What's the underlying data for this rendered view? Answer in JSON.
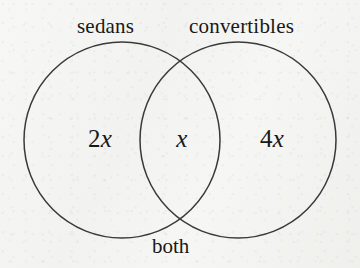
{
  "figure": {
    "kind": "venn-diagram",
    "background_color": "#f5f5f3",
    "stroke_color": "#3a3a3a",
    "text_color": "#181818"
  },
  "sets": {
    "left": {
      "name_label": "sedans",
      "region_prefix": "2",
      "region_variable": "x"
    },
    "right": {
      "name_label": "convertibles",
      "region_prefix": "4",
      "region_variable": "x"
    },
    "intersection": {
      "name_label": "both",
      "region_prefix": "",
      "region_variable": "x"
    }
  },
  "geometry": {
    "left_circle": {
      "cx": 122,
      "cy": 140,
      "r": 98
    },
    "right_circle": {
      "cx": 238,
      "cy": 140,
      "r": 98
    },
    "stroke_width": 1.5
  }
}
